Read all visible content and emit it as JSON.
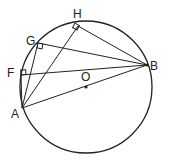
{
  "diagram": {
    "circle": {
      "cx": 86,
      "cy": 87,
      "r": 66
    },
    "points": {
      "A": {
        "label": "A",
        "x": 22,
        "y": 108,
        "lx": 11,
        "ly": 118
      },
      "B": {
        "label": "B",
        "x": 147,
        "y": 65,
        "lx": 150,
        "ly": 70
      },
      "O": {
        "label": "O",
        "x": 86,
        "y": 87,
        "lx": 81,
        "ly": 81
      },
      "F": {
        "label": "F",
        "x": 21,
        "y": 75,
        "lx": 7,
        "ly": 77
      },
      "G": {
        "label": "G",
        "x": 38,
        "y": 43,
        "lx": 26,
        "ly": 45
      },
      "H": {
        "label": "H",
        "x": 78,
        "y": 26,
        "lx": 73,
        "ly": 18
      }
    },
    "segments": [
      "AB",
      "AF",
      "AG",
      "AH",
      "FB",
      "GB",
      "HB"
    ],
    "right_angles": [
      "F",
      "G",
      "H"
    ],
    "stroke_color": "#222222"
  }
}
